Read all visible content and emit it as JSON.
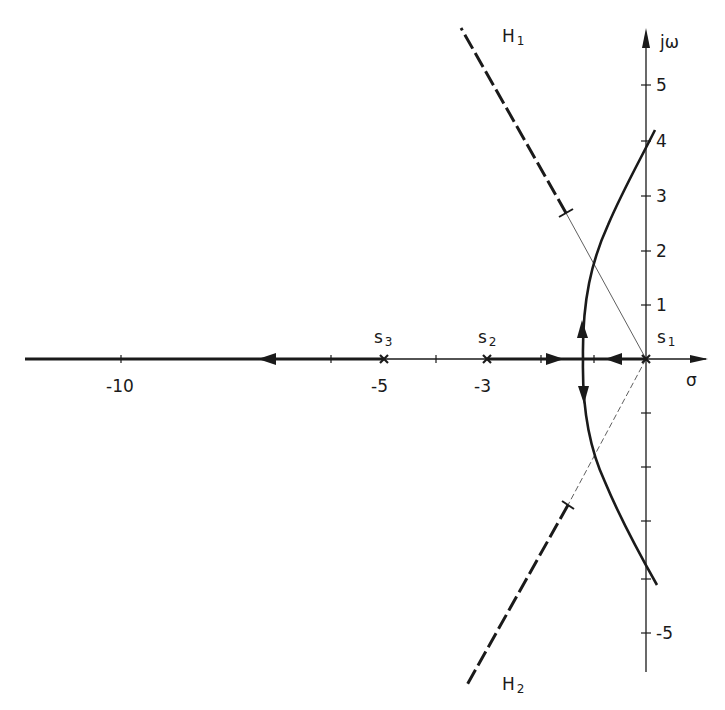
{
  "diagram": {
    "type": "root-locus",
    "colors": {
      "ink": "#1a1a1a",
      "background": "#ffffff"
    },
    "axes": {
      "real_axis_label": "σ",
      "imag_axis_label": "jω",
      "real_ticks": [
        {
          "value": -10,
          "label": "-10"
        },
        {
          "value": -5,
          "label": "-5"
        },
        {
          "value": -3,
          "label": "-3"
        }
      ],
      "imag_ticks": [
        {
          "value": 5,
          "label": "5"
        },
        {
          "value": 4,
          "label": "4"
        },
        {
          "value": 3,
          "label": "3"
        },
        {
          "value": 2,
          "label": "2"
        },
        {
          "value": 1,
          "label": "1"
        },
        {
          "value": -5,
          "label": "-5"
        }
      ]
    },
    "poles": [
      {
        "name": "s",
        "sub": "1",
        "re": 0,
        "im": 0
      },
      {
        "name": "s",
        "sub": "2",
        "re": -3,
        "im": 0
      },
      {
        "name": "s",
        "sub": "3",
        "re": -5,
        "im": 0
      }
    ],
    "asymptotes": [
      {
        "name": "H",
        "sub": "1",
        "direction": "upper-left"
      },
      {
        "name": "H",
        "sub": "2",
        "direction": "lower-left"
      }
    ],
    "branches": [
      {
        "description": "from s1 leftward along real axis to breakaway point near -1.3"
      },
      {
        "description": "from s2 rightward along real axis to breakaway point near -1.3"
      },
      {
        "description": "from s3 leftward along real axis to -infinity"
      },
      {
        "description": "complex branch rising from breakaway, crossing jω axis at about +4"
      },
      {
        "description": "complex branch descending from breakaway, crossing jω axis at about -4"
      }
    ]
  }
}
